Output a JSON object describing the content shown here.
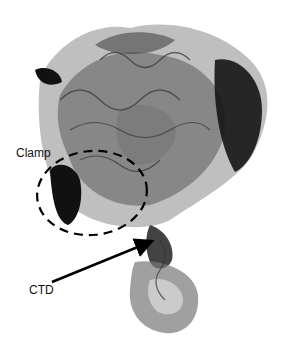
{
  "figure": {
    "labels": {
      "clamp": "Clamp",
      "ctd": "CTD"
    },
    "annotations": [
      {
        "type": "dashed-ellipse",
        "target": "Clamp"
      },
      {
        "type": "arrow",
        "target": "CTD"
      }
    ],
    "colors": {
      "background": "#ffffff",
      "dark": "#111111",
      "mid": "#6e6e6e",
      "light": "#b4b4b4"
    }
  }
}
